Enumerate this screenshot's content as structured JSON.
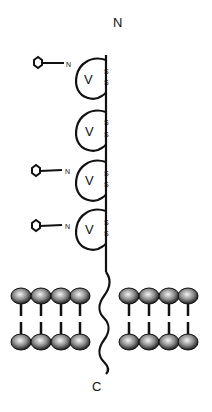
{
  "diagram": {
    "type": "protein-membrane-topology",
    "terminus_labels": {
      "n_terminus": "N",
      "c_terminus": "C"
    },
    "domains": [
      {
        "label": "V",
        "disulfide": [
          "S",
          "S"
        ],
        "glycosylated": true,
        "glycan_site_label": "N"
      },
      {
        "label": "V",
        "disulfide": [
          "S",
          "S"
        ],
        "glycosylated": false,
        "glycan_site_label": ""
      },
      {
        "label": "V",
        "disulfide": [
          "S",
          "S"
        ],
        "glycosylated": true,
        "glycan_site_label": "N"
      },
      {
        "label": "V",
        "disulfide": [
          "S",
          "S"
        ],
        "glycosylated": true,
        "glycan_site_label": "N"
      }
    ],
    "membrane": {
      "lipids_left": 4,
      "lipids_right": 4,
      "head_color": "#9a9a9a",
      "head_highlight": "#f0f0f0",
      "tail_color": "#111111"
    },
    "colors": {
      "line": "#111111",
      "background": "#ffffff"
    }
  }
}
